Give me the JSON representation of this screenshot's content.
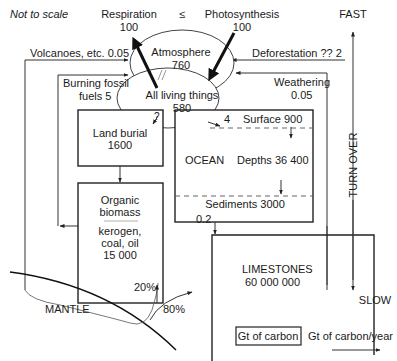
{
  "title_note": "Not to scale",
  "flows_top": {
    "respiration": {
      "label": "Respiration",
      "value": "100"
    },
    "equilibrium_symbol": "≤",
    "photosynthesis": {
      "label": "Photosynthesis",
      "value": "100"
    }
  },
  "reservoirs": {
    "atmosphere": {
      "label": "Atmosphere",
      "value": "760"
    },
    "living": {
      "label": "All living things",
      "value": "580"
    },
    "land_burial": {
      "label": "Land burial",
      "value": "1600"
    },
    "organic": {
      "label1": "Organic",
      "label2": "biomass",
      "label3": "kerogen,",
      "label4": "coal, oil",
      "value": "15 000"
    },
    "ocean": {
      "label": "OCEAN",
      "surface": "Surface 900",
      "depths": "Depths 36 400",
      "sediments": "Sediments 3000"
    },
    "limestones": {
      "label": "LIMESTONES",
      "value": "60 000 000"
    },
    "mantle": {
      "label": "MANTLE"
    }
  },
  "fluxes": {
    "volcanoes": "Volcanoes, etc.  0.05",
    "burning1": "Burning fossil",
    "burning2": "fuels 5",
    "deforestation": "Deforestation  ?? 2",
    "weathering1": "Weathering",
    "weathering2": "0.05",
    "land_burial_q": "?",
    "ocean_in": "4",
    "sediment_out": "0.2",
    "subduct_organic": "20%",
    "subduct_lime": "80%"
  },
  "turnover": {
    "fast": "FAST",
    "label": "TURN OVER",
    "slow": "SLOW"
  },
  "legend": {
    "stock": "Gt of carbon",
    "flux": "Gt of carbon/year"
  }
}
